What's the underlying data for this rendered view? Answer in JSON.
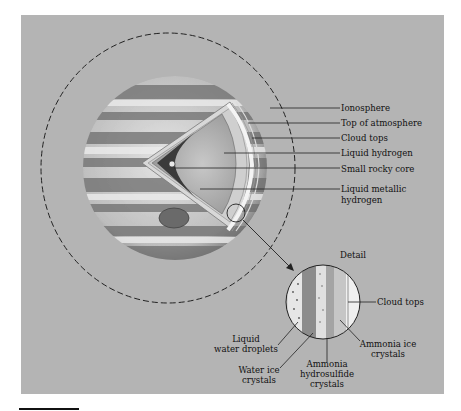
{
  "figure": {
    "colors": {
      "panel": "#b4b4b4",
      "planet_light": "#e6e6e6",
      "planet_dark": "#5a5a5a",
      "line": "#1a1a1a"
    },
    "planet_labels": [
      {
        "id": "ionosphere",
        "text": "Ionosphere"
      },
      {
        "id": "top-of-atmosphere",
        "text": "Top of atmosphere"
      },
      {
        "id": "cloud-tops",
        "text": "Cloud tops"
      },
      {
        "id": "liquid-hydrogen",
        "text": "Liquid hydrogen"
      },
      {
        "id": "small-rocky-core",
        "text": "Small rocky core"
      },
      {
        "id": "liquid-metallic-hydrogen",
        "text": "Liquid metallic hydrogen",
        "line1": "Liquid metallic",
        "line2": "hydrogen"
      }
    ],
    "detail": {
      "title": "Detail",
      "labels": {
        "cloud_tops": "Cloud tops",
        "liquid_water_droplets": {
          "line1": "Liquid",
          "line2": "water droplets"
        },
        "water_ice_crystals": {
          "line1": "Water ice",
          "line2": "crystals"
        },
        "ammonia_hydrosulfide_crystals": {
          "line1": "Ammonia",
          "line2": "hydrosulfide",
          "line3": "crystals"
        },
        "ammonia_ice_crystals": {
          "line1": "Ammonia ice",
          "line2": "crystals"
        }
      }
    }
  }
}
